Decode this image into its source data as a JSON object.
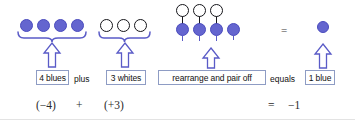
{
  "figure": {
    "colors": {
      "blue_counter_fill": "#6465cf",
      "blue_counter_stroke": "#4a4bbd",
      "white_counter_stroke": "#15151a",
      "brace_and_arrow": "#5a5bc7",
      "text_box_border": "#8e9cc4",
      "text": "#111111",
      "background": "#ffffff"
    }
  },
  "groups": {
    "blues": {
      "count": 4,
      "counter_type": "blue",
      "label": "4 blues",
      "math": "(−4)"
    },
    "whites": {
      "count": 3,
      "counter_type": "white",
      "label": "3 whites",
      "math": "(+3)"
    },
    "mixed": {
      "blue_count": 4,
      "white_count": 3,
      "paired_count": 3,
      "label": "rearrange and pair off",
      "math": ""
    },
    "result": {
      "count": 1,
      "counter_type": "blue",
      "label": "1 blue",
      "math": "−1"
    }
  },
  "operators": {
    "plus_word": "plus",
    "equals_word": "equals",
    "plus_symbol": "+",
    "equals_symbol": "=",
    "equals_symbol_top": "="
  }
}
